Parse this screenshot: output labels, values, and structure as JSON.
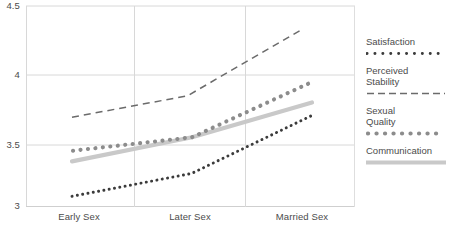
{
  "chart_data": {
    "type": "line",
    "title": "",
    "xlabel": "",
    "ylabel": "",
    "categories": [
      "Early Sex",
      "Later Sex",
      "Married Sex"
    ],
    "ylim": [
      3,
      4.5
    ],
    "yticks": [
      "4.5",
      "4",
      "3.5",
      "3"
    ],
    "ytick_values": [
      4.5,
      4,
      3.5,
      3
    ],
    "grid": true,
    "legend_position": "right",
    "series": [
      {
        "name": "Satisfaction",
        "style": "dotted-small",
        "color": "#3b3b3b",
        "values": [
          3.08,
          3.25,
          3.68
        ]
      },
      {
        "name": "Perceived Stability",
        "style": "dashed",
        "color": "#6b6b6b",
        "values": [
          3.67,
          3.83,
          4.33
        ]
      },
      {
        "name": "Sexual Quality",
        "style": "dotted-large",
        "color": "#8c8c8c",
        "values": [
          3.42,
          3.52,
          3.93
        ]
      },
      {
        "name": "Communication",
        "style": "solid-thick",
        "color": "#c9c9c9",
        "values": [
          3.34,
          3.52,
          3.78
        ]
      }
    ]
  },
  "axis": {
    "y_ticks": [
      {
        "label": "4.5"
      },
      {
        "label": "4"
      },
      {
        "label": "3.5"
      },
      {
        "label": "3"
      }
    ],
    "x_ticks": [
      {
        "label": "Early Sex"
      },
      {
        "label": "Later Sex"
      },
      {
        "label": "Married Sex"
      }
    ]
  },
  "legend": {
    "items": [
      {
        "label": "Satisfaction"
      },
      {
        "label": "Perceived",
        "label2": "Stability"
      },
      {
        "label": "Sexual",
        "label2": "Quality"
      },
      {
        "label": "Communication"
      }
    ]
  },
  "colors": {
    "grid": "#d8d8d8",
    "satisfaction": "#3b3b3b",
    "perceived_stability": "#6b6b6b",
    "sexual_quality": "#8c8c8c",
    "communication": "#c9c9c9",
    "text": "#4b4b4b"
  }
}
